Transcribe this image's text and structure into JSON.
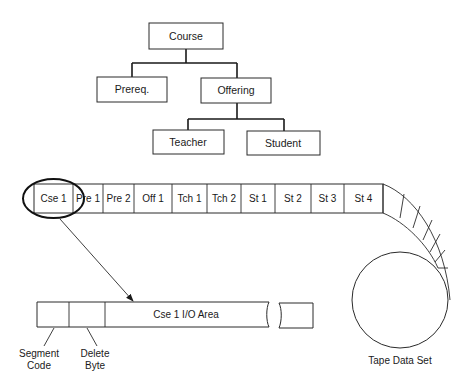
{
  "hierarchy": {
    "root": {
      "label": "Course"
    },
    "children": [
      {
        "label": "Prereq."
      },
      {
        "label": "Offering"
      }
    ],
    "grandchildren": [
      {
        "label": "Teacher"
      },
      {
        "label": "Student"
      }
    ]
  },
  "tape_strip": {
    "segments": [
      {
        "label": "Cse 1"
      },
      {
        "label": "Pre 1"
      },
      {
        "label": "Pre 2"
      },
      {
        "label": "Off 1"
      },
      {
        "label": "Tch 1"
      },
      {
        "label": "Tch 2"
      },
      {
        "label": "St 1"
      },
      {
        "label": "St 2"
      },
      {
        "label": "St 3"
      },
      {
        "label": "St 4"
      }
    ],
    "highlighted_segment": "Cse 1"
  },
  "io_area": {
    "main_label": "Cse 1 I/O Area",
    "segment_code_label": [
      "Segment",
      "Code"
    ],
    "delete_byte_label": [
      "Delete",
      "Byte"
    ]
  },
  "tape_reel": {
    "label": "Tape Data Set"
  }
}
